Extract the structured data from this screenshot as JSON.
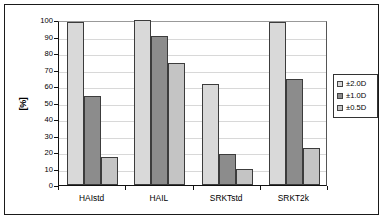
{
  "chart_data": {
    "type": "bar",
    "title": "",
    "xlabel": "",
    "ylabel": "[%]",
    "ylim": [
      0,
      100
    ],
    "yticks": [
      0,
      10,
      20,
      30,
      40,
      50,
      60,
      70,
      80,
      90,
      100
    ],
    "grid": true,
    "legend_position": "right",
    "categories": [
      "HAIstd",
      "HAIL",
      "SRKTstd",
      "SRKT2k"
    ],
    "series": [
      {
        "name": "±2.0D",
        "color": "#d9d9d9",
        "values": [
          98.5,
          100,
          61,
          99
        ]
      },
      {
        "name": "±1.0D",
        "color": "#8c8c8c",
        "values": [
          54,
          90.5,
          19,
          64.5
        ]
      },
      {
        "name": "±0.5D",
        "color": "#c4c4c4",
        "values": [
          17,
          74,
          9.5,
          22.5
        ]
      }
    ]
  },
  "legend": {
    "items": [
      {
        "label": "±2.0D"
      },
      {
        "label": "±1.0D"
      },
      {
        "label": "±0.5D"
      }
    ]
  }
}
